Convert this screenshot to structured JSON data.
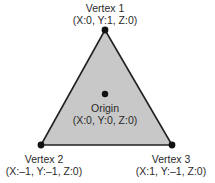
{
  "diagram": {
    "fill_color": "#c8c8c8",
    "stroke_color": "#222222",
    "vertices": [
      {
        "name": "Vertex 1",
        "coords": "(X:0, Y:1, Z:0)"
      },
      {
        "name": "Vertex 2",
        "coords": "(X:–1, Y:–1, Z:0)"
      },
      {
        "name": "Vertex 3",
        "coords": "(X:1, Y:–1, Z:0)"
      }
    ],
    "origin": {
      "name": "Origin",
      "coords": "(X:0, Y:0, Z:0)"
    }
  }
}
